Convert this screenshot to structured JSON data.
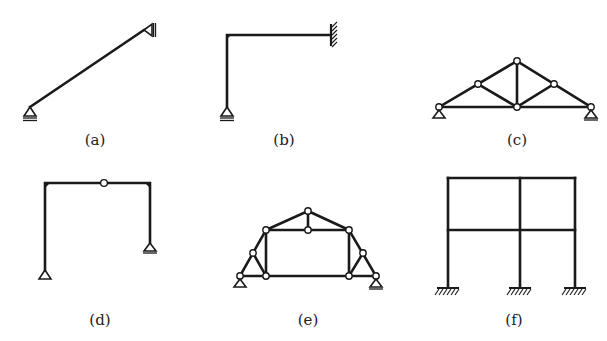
{
  "figure": {
    "panels": [
      {
        "id": "a",
        "label": "(a)",
        "type": "inclined-beam",
        "supports": [
          "pin-roller bottom-left",
          "pin top-right (wall)"
        ]
      },
      {
        "id": "b",
        "label": "(b)",
        "type": "L-frame",
        "supports": [
          "pin-roller bottom",
          "fixed right wall"
        ]
      },
      {
        "id": "c",
        "label": "(c)",
        "type": "triangular-truss",
        "supports": [
          "pin left",
          "roller right"
        ],
        "joints": 6
      },
      {
        "id": "d",
        "label": "(d)",
        "type": "three-hinged-portal-frame",
        "supports": [
          "pin left",
          "roller right"
        ],
        "internal_hinges": 1
      },
      {
        "id": "e",
        "label": "(e)",
        "type": "composite-truss",
        "supports": [
          "pin left",
          "roller right"
        ],
        "joints": 10
      },
      {
        "id": "f",
        "label": "(f)",
        "type": "two-story-two-bay-rigid-frame",
        "supports": [
          "fixed",
          "fixed",
          "fixed"
        ]
      }
    ]
  },
  "colors": {
    "line": "#1a1a1a",
    "background": "#ffffff"
  }
}
